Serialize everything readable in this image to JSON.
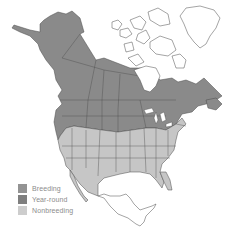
{
  "map": {
    "region": "North America",
    "colors": {
      "breeding": "#939393",
      "year_round": "#8a8a8a",
      "nonbreeding": "#c6c6c6",
      "outline": "#4a4a4a",
      "background": "#ffffff"
    }
  },
  "legend": {
    "items": [
      {
        "label": "Breeding",
        "color": "#939393"
      },
      {
        "label": "Year-round",
        "color": "#7f7f7f"
      },
      {
        "label": "Nonbreeding",
        "color": "#cdcdcd"
      }
    ]
  }
}
